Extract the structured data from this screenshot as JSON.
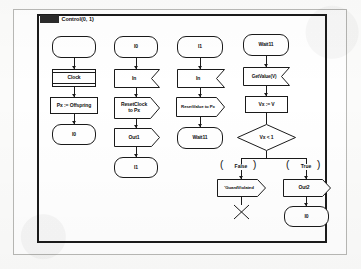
{
  "diagram": {
    "frame": {
      "keyword": "process",
      "name": "Control(0, 1)",
      "title_full": "process Control(0, 1)"
    },
    "type": "sdl-process-flowchart",
    "columns": [
      {
        "id": "column-1",
        "nodes": [
          {
            "id": "n1-start",
            "shape": "state",
            "label": ""
          },
          {
            "id": "n1-clock",
            "shape": "timer",
            "label": "Clock"
          },
          {
            "id": "n1-task",
            "shape": "task",
            "label": "Px := Offspring"
          },
          {
            "id": "n1-i0",
            "shape": "state",
            "label": "I0"
          }
        ]
      },
      {
        "id": "column-2",
        "nodes": [
          {
            "id": "n2-i0",
            "shape": "state",
            "label": "I0"
          },
          {
            "id": "n2-in",
            "shape": "input",
            "label": "In"
          },
          {
            "id": "n2-reset",
            "shape": "process",
            "label": "ResetClock\nto Px"
          },
          {
            "id": "n2-out1",
            "shape": "output",
            "label": "Out1"
          },
          {
            "id": "n2-i1",
            "shape": "state",
            "label": "I1"
          }
        ]
      },
      {
        "id": "column-3",
        "nodes": [
          {
            "id": "n3-i1",
            "shape": "state",
            "label": "I1"
          },
          {
            "id": "n3-in",
            "shape": "input",
            "label": "In"
          },
          {
            "id": "n3-reset",
            "shape": "process",
            "label": "ResetValue to Px"
          },
          {
            "id": "n3-wait",
            "shape": "state",
            "label": "Wait11"
          }
        ]
      },
      {
        "id": "column-4",
        "nodes": [
          {
            "id": "n4-wait",
            "shape": "state",
            "label": "Wait11"
          },
          {
            "id": "n4-getvalue",
            "shape": "input",
            "label": "GetValue(V)"
          },
          {
            "id": "n4-assign",
            "shape": "task",
            "label": "Vx := V"
          },
          {
            "id": "n4-decision",
            "shape": "decision",
            "label": "Vx < 1"
          },
          {
            "id": "n4-guard-false",
            "shape": "guard",
            "label": "False"
          },
          {
            "id": "n4-guard-true",
            "shape": "guard",
            "label": "True"
          },
          {
            "id": "n4-guardviolated",
            "shape": "output",
            "label": "'GuardViolated"
          },
          {
            "id": "n4-stop",
            "shape": "stop",
            "label": ""
          },
          {
            "id": "n4-out2",
            "shape": "output",
            "label": "Out2"
          },
          {
            "id": "n4-i0",
            "shape": "state",
            "label": "I0"
          }
        ]
      }
    ],
    "colors": {
      "stroke": "#1a1a1a",
      "fill": "#ffffff",
      "page": "#fbfbfa",
      "sheet_border": "#b8b8b5"
    }
  }
}
